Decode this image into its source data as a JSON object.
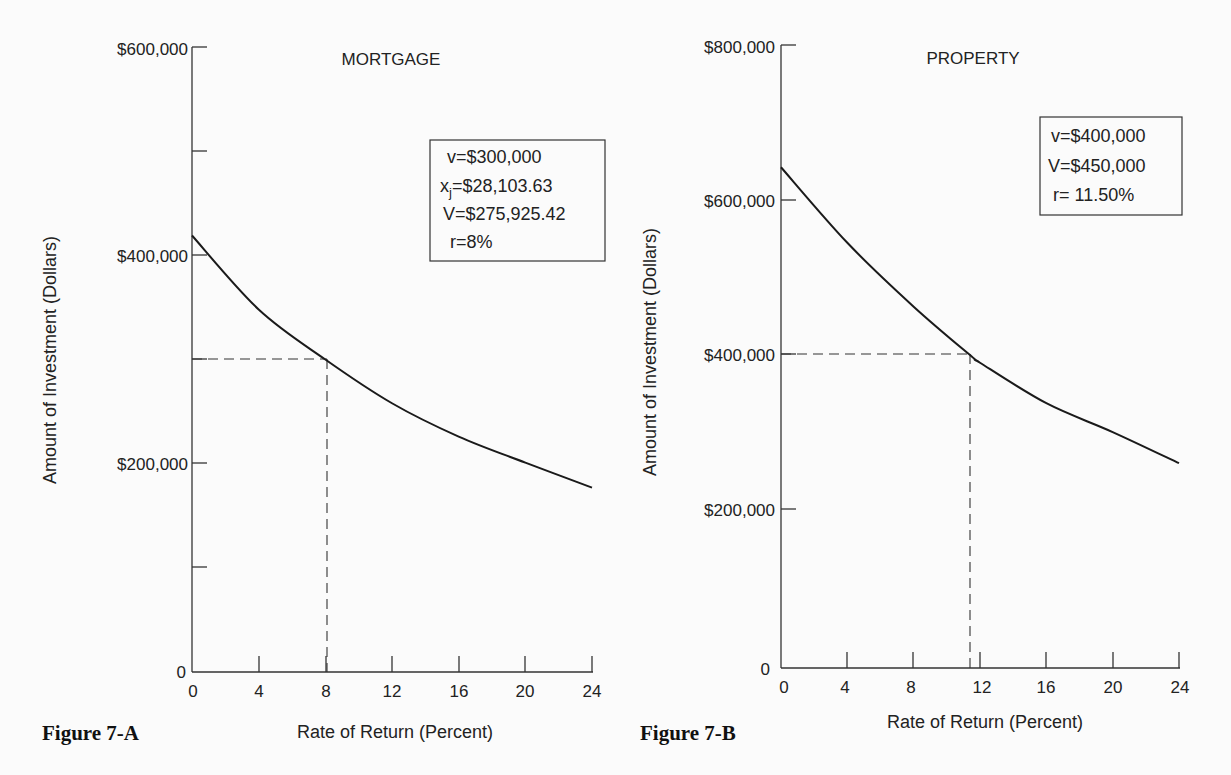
{
  "chart_data": [
    {
      "type": "line",
      "figure_label": "Figure 7-A",
      "title": "MORTGAGE",
      "xlabel": "Rate of Return (Percent)",
      "ylabel": "Amount of Investment (Dollars)",
      "xlim": [
        0,
        24
      ],
      "ylim": [
        0,
        600000
      ],
      "x_ticks": [
        0,
        4,
        8,
        12,
        16,
        20,
        24
      ],
      "y_ticks": [
        0,
        100000,
        200000,
        300000,
        400000,
        500000,
        600000
      ],
      "y_tick_labels": [
        "0",
        "",
        "$200,000",
        "",
        "$400,000",
        "",
        "$600,000"
      ],
      "grid": false,
      "series": [
        {
          "name": "Mortgage value",
          "x": [
            0,
            4,
            8,
            12,
            16,
            20,
            24
          ],
          "y": [
            419000,
            348000,
            300000,
            258000,
            226000,
            201000,
            177000
          ]
        }
      ],
      "reference_point": {
        "x": 8,
        "y": 300000,
        "style": "dashed"
      },
      "annotation_box": [
        "v=$300,000",
        "xj=$28,103.63",
        "V=$275,925.42",
        "r=8%"
      ]
    },
    {
      "type": "line",
      "figure_label": "Figure 7-B",
      "title": "PROPERTY",
      "xlabel": "Rate of Return  (Percent)",
      "ylabel": "Amount of Investment (Dollars)",
      "xlim": [
        0,
        24
      ],
      "ylim": [
        0,
        800000
      ],
      "x_ticks": [
        0,
        4,
        8,
        12,
        16,
        20,
        24
      ],
      "y_ticks": [
        0,
        200000,
        400000,
        600000,
        800000
      ],
      "y_tick_labels": [
        "0",
        "$200,000",
        "$400,000",
        "$600,000",
        "$800,000"
      ],
      "grid": false,
      "series": [
        {
          "name": "Property value",
          "x": [
            0,
            4,
            8,
            11.5,
            12,
            16,
            20,
            24
          ],
          "y": [
            643000,
            546000,
            464000,
            400000,
            392000,
            340000,
            303000,
            263000
          ]
        }
      ],
      "reference_point": {
        "x": 11.5,
        "y": 400000,
        "style": "dashed"
      },
      "annotation_box": [
        "v=$400,000",
        "V=$450,000",
        "r= 11.50%"
      ]
    }
  ],
  "charts": {
    "a": {
      "figure_label": "Figure 7-A",
      "title": "MORTGAGE",
      "xlabel": "Rate of Return (Percent)",
      "ylabel": "Amount of Investment (Dollars)",
      "y_labels": {
        "top": "$600,000",
        "mid": "$400,000",
        "low": "$200,000",
        "zero": "0"
      },
      "x_labels": [
        "0",
        "4",
        "8",
        "12",
        "16",
        "20",
        "24"
      ],
      "box": {
        "line1": "v=$300,000",
        "line2_main": "x",
        "line2_sub": "j",
        "line2_rest": "=$28,103.63",
        "line3": "V=$275,925.42",
        "line4": "r=8%"
      }
    },
    "b": {
      "figure_label": "Figure 7-B",
      "title": "PROPERTY",
      "xlabel": "Rate of Return  (Percent)",
      "ylabel": "Amount of Investment (Dollars)",
      "y_labels": {
        "top": "$800,000",
        "upper": "$600,000",
        "mid": "$400,000",
        "low": "$200,000",
        "zero": "0"
      },
      "x_labels": [
        "0",
        "4",
        "8",
        "12",
        "16",
        "20",
        "24"
      ],
      "box": {
        "line1": "v=$400,000",
        "line2": "V=$450,000",
        "line3": "r= 11.50%"
      }
    }
  }
}
